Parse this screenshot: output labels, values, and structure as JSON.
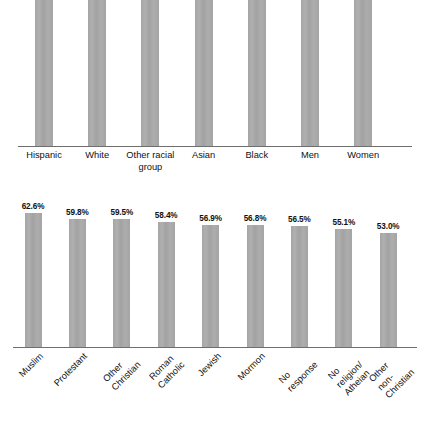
{
  "chart_data": [
    {
      "type": "bar",
      "title": "",
      "subtitle": "",
      "xlabel": "",
      "ylabel": "",
      "ylim": [
        0,
        66
      ],
      "grid": false,
      "legend": "none",
      "axis_visible": "x-only",
      "value_label_format": "percent-one-decimal",
      "bar_color": "#a9a9a9",
      "tick_label_rotation": 0,
      "categories": [
        "Hispanic",
        "White",
        "Other racial\ngroup",
        "Asian",
        "Black",
        "Men",
        "Women"
      ],
      "values": [
        58.2,
        58.0,
        57.0,
        54.8,
        54.4,
        55.1,
        60.0
      ],
      "value_labels": [
        "58.2%",
        "58.0%",
        "57.0%",
        "54.8%",
        "54.4%",
        "55.1%",
        "60.0%"
      ]
    },
    {
      "type": "bar",
      "title": "",
      "subtitle": "",
      "xlabel": "",
      "ylabel": "",
      "ylim": [
        0,
        70
      ],
      "grid": false,
      "legend": "none",
      "axis_visible": "x-only",
      "value_label_format": "percent-one-decimal",
      "bar_color": "#a9a9a9",
      "tick_label_rotation": -45,
      "categories": [
        "Muslim",
        "Protestant",
        "Other Christian",
        "Roman Catholic",
        "Jewish",
        "Mormon",
        "No response",
        "No religion/\nAtheian",
        "Other\nnon-Christian"
      ],
      "values": [
        62.6,
        59.8,
        59.5,
        58.4,
        56.9,
        56.8,
        56.5,
        55.1,
        53.0
      ],
      "value_labels": [
        "62.6%",
        "59.8%",
        "59.5%",
        "58.4%",
        "56.9%",
        "56.8%",
        "56.5%",
        "55.1%",
        "53.0%"
      ]
    }
  ]
}
